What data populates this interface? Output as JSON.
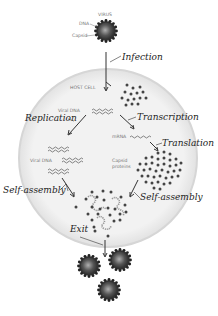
{
  "diagram": {
    "colors": {
      "cell_fill": "#efefef",
      "cell_border": "#d0d0d0",
      "virus_core": "#5a5a5a",
      "dots": "#444444",
      "text_small": "#777777",
      "text_hand": "#222222"
    },
    "virus_labels": {
      "virus": "VIRUS",
      "dna": "DNA",
      "capsid": "Capsid"
    },
    "cell_label": "HOST CELL",
    "molecule_labels": {
      "viral_dna_top": "Viral DNA",
      "viral_dna_left": "Viral DNA",
      "mrna": "mRNA",
      "capsid_proteins_line1": "Capsid",
      "capsid_proteins_line2": "proteins"
    },
    "steps": [
      {
        "id": "infection",
        "label": "Infection"
      },
      {
        "id": "replication",
        "label": "Replication"
      },
      {
        "id": "transcription",
        "label": "Transcription"
      },
      {
        "id": "translation",
        "label": "Translation"
      },
      {
        "id": "self-assembly-left",
        "label": "Self-assembly"
      },
      {
        "id": "self-assembly-right",
        "label": "Self-assembly"
      },
      {
        "id": "exit",
        "label": "Exit"
      }
    ],
    "released_virions": 3
  }
}
